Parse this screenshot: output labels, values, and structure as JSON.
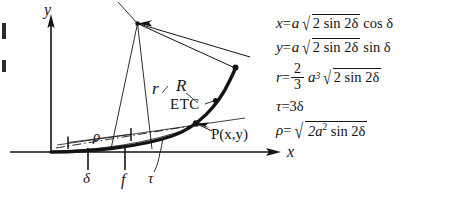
{
  "figure": {
    "background_color": "#ffffff",
    "ink_color": "#141414",
    "width": 456,
    "height": 211
  },
  "axes": {
    "x_label": "x",
    "y_label": "y",
    "origin_label": ""
  },
  "diagram_labels": {
    "r": "r",
    "R": "R",
    "etc": "ETC",
    "point": "P(x,y)",
    "rho": "ρ",
    "delta": "δ",
    "f": "f",
    "tau": "τ"
  },
  "equations": [
    {
      "id": "eq-x",
      "lhs": "x",
      "eq": "=",
      "coefficient": "a",
      "radicand": "2 sin 2δ",
      "trailing": "cos δ",
      "full_text": "x = a √(2 sin 2δ) cos δ"
    },
    {
      "id": "eq-y",
      "lhs": "y",
      "eq": "=",
      "coefficient": "a",
      "radicand": "2 sin 2δ",
      "trailing": "sin δ",
      "full_text": "y = a √(2 sin 2δ) sin δ"
    },
    {
      "id": "eq-r",
      "lhs": "r",
      "eq": "=",
      "fraction_numerator": "2",
      "fraction_denominator": "3",
      "coefficient": "a",
      "exponent": "3",
      "radicand": "2 sin 2δ",
      "trailing": "",
      "full_text": "r = (2/3) a³ √(2 sin 2δ)"
    },
    {
      "id": "eq-tau",
      "lhs": "τ",
      "eq": "=",
      "rhs": "3δ",
      "full_text": "τ = 3δ"
    },
    {
      "id": "eq-rho",
      "lhs": "ρ",
      "eq": "=",
      "radicand_lead": "2a",
      "radicand_exp": "2",
      "radicand_tail": "sin 2δ",
      "full_text": "ρ = √(2a² sin 2δ)"
    }
  ]
}
